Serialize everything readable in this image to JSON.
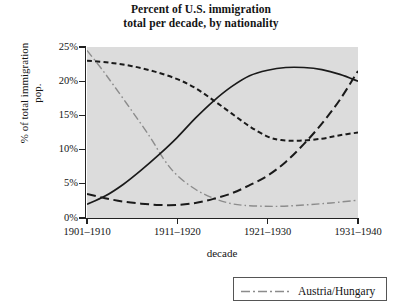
{
  "title": {
    "line1": "Percent of U.S. immigration",
    "line2": "total per decade, by nationality"
  },
  "axes": {
    "y_title_line1": "% of total immigration",
    "y_title_line2": "pop.",
    "x_title": "decade",
    "y_ticks": [
      "0%",
      "5%",
      "10%",
      "15%",
      "20%",
      "25%"
    ],
    "x_ticks": [
      "1901–1910",
      "1911–1920",
      "1921–1930",
      "1931–1940"
    ]
  },
  "legend": {
    "items": [
      {
        "label": "Austria/Hungary",
        "style": "dash-dot",
        "color": "#8c8c8c"
      }
    ]
  },
  "colors": {
    "plot_background": "#dcdcdc",
    "axis": "#222222",
    "page_background": "#ffffff",
    "series_dark": "#1a1a1a",
    "series_gray": "#8c8c8c"
  },
  "chart_data": {
    "type": "line",
    "title": "Percent of U.S. immigration total per decade, by nationality",
    "xlabel": "decade",
    "ylabel": "% of total immigration pop.",
    "categories": [
      "1901–1910",
      "1911–1920",
      "1921–1930",
      "1931–1940"
    ],
    "ylim": [
      0,
      25
    ],
    "ytick_values": [
      0,
      5,
      10,
      15,
      20,
      25
    ],
    "grid": false,
    "legend_position": "bottom",
    "series": [
      {
        "name": "Austria/Hungary",
        "style": "dash-dot",
        "color": "#8c8c8c",
        "values": [
          24.5,
          12.0,
          3.0,
          2.5
        ],
        "points": [
          [
            0.0,
            24.5
          ],
          [
            0.15,
            22.0
          ],
          [
            0.3,
            19.3
          ],
          [
            0.5,
            15.6
          ],
          [
            0.7,
            11.8
          ],
          [
            0.85,
            8.6
          ],
          [
            1.0,
            6.2
          ],
          [
            1.2,
            4.2
          ],
          [
            1.4,
            2.9
          ],
          [
            1.6,
            2.1
          ],
          [
            1.8,
            1.8
          ],
          [
            2.1,
            1.7
          ],
          [
            2.4,
            1.9
          ],
          [
            2.7,
            2.2
          ],
          [
            3.0,
            2.6
          ]
        ]
      },
      {
        "name": "series-short-dash",
        "style": "short-dash",
        "color": "#1a1a1a",
        "values": [
          23.0,
          21.0,
          11.4,
          12.5
        ],
        "points": [
          [
            0.0,
            23.0
          ],
          [
            0.25,
            22.7
          ],
          [
            0.5,
            22.2
          ],
          [
            0.75,
            21.4
          ],
          [
            1.0,
            20.3
          ],
          [
            1.2,
            19.0
          ],
          [
            1.4,
            17.2
          ],
          [
            1.6,
            15.3
          ],
          [
            1.8,
            13.4
          ],
          [
            2.0,
            11.9
          ],
          [
            2.15,
            11.4
          ],
          [
            2.35,
            11.3
          ],
          [
            2.6,
            11.6
          ],
          [
            2.8,
            12.1
          ],
          [
            3.0,
            12.5
          ]
        ]
      },
      {
        "name": "series-solid",
        "style": "solid",
        "color": "#1a1a1a",
        "values": [
          2.0,
          11.5,
          21.8,
          20.0
        ],
        "points": [
          [
            0.0,
            2.0
          ],
          [
            0.2,
            3.2
          ],
          [
            0.4,
            4.9
          ],
          [
            0.6,
            7.0
          ],
          [
            0.8,
            9.3
          ],
          [
            1.0,
            11.8
          ],
          [
            1.2,
            14.6
          ],
          [
            1.4,
            17.1
          ],
          [
            1.6,
            19.2
          ],
          [
            1.8,
            20.8
          ],
          [
            2.0,
            21.6
          ],
          [
            2.2,
            22.0
          ],
          [
            2.4,
            22.0
          ],
          [
            2.6,
            21.7
          ],
          [
            2.8,
            21.0
          ],
          [
            3.0,
            20.0
          ]
        ]
      },
      {
        "name": "series-long-dash",
        "style": "long-dash",
        "color": "#1a1a1a",
        "values": [
          3.5,
          1.9,
          7.5,
          21.5
        ],
        "points": [
          [
            0.0,
            3.5
          ],
          [
            0.2,
            2.9
          ],
          [
            0.4,
            2.4
          ],
          [
            0.6,
            2.1
          ],
          [
            0.8,
            1.9
          ],
          [
            1.0,
            1.9
          ],
          [
            1.2,
            2.2
          ],
          [
            1.4,
            2.8
          ],
          [
            1.6,
            3.6
          ],
          [
            1.8,
            4.8
          ],
          [
            2.0,
            6.2
          ],
          [
            2.2,
            8.2
          ],
          [
            2.4,
            10.8
          ],
          [
            2.6,
            13.8
          ],
          [
            2.8,
            17.3
          ],
          [
            3.0,
            21.5
          ]
        ]
      }
    ]
  }
}
